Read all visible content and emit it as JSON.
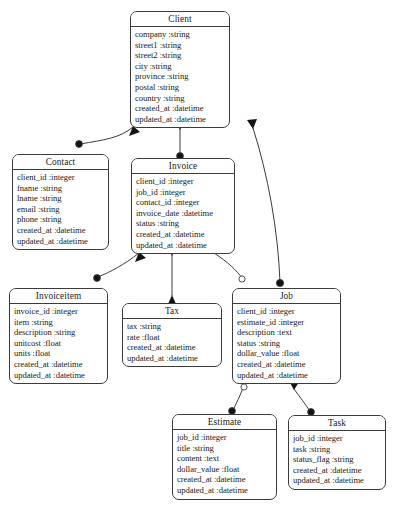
{
  "diagram": {
    "kind": "entity-relationship-diagram",
    "background_color": "#ffffff",
    "line_color": "#3b3b3b",
    "text_color": "#1a1a1a",
    "width": 393,
    "height": 506,
    "entities": [
      {
        "id": "client",
        "name": "Client",
        "fields": [
          "company :string",
          "street1 :string",
          "street2 :string",
          "city :string",
          "province :string",
          "postal :string",
          "country :string",
          "created_at :datetime",
          "updated_at :datetime"
        ]
      },
      {
        "id": "contact",
        "name": "Contact",
        "fields": [
          "client_id :integer",
          "fname :string",
          "lname :string",
          "email :string",
          "phone :string",
          "created_at :datetime",
          "updated_at :datetime"
        ]
      },
      {
        "id": "invoice",
        "name": "Invoice",
        "fields": [
          "client_id :integer",
          "job_id :integer",
          "contact_id :integer",
          "invoice_date :datetime",
          "status :string",
          "created_at :datetime",
          "updated_at :datetime"
        ]
      },
      {
        "id": "invoiceitem",
        "name": "Invoiceitem",
        "fields": [
          "invoice_id :integer",
          "item :string",
          "description :string",
          "unitcost :float",
          "units :float",
          "created_at :datetime",
          "updated_at :datetime"
        ]
      },
      {
        "id": "tax",
        "name": "Tax",
        "fields": [
          "tax :string",
          "rate :float",
          "created_at :datetime",
          "updated_at :datetime"
        ]
      },
      {
        "id": "job",
        "name": "Job",
        "fields": [
          "client_id :integer",
          "estimate_id :integer",
          "description :text",
          "status :string",
          "dollar_value :float",
          "created_at :datetime",
          "updated_at :datetime"
        ]
      },
      {
        "id": "estimate",
        "name": "Estimate",
        "fields": [
          "job_id :integer",
          "title :string",
          "content :text",
          "dollar_value :float",
          "created_at :datetime",
          "updated_at :datetime"
        ]
      },
      {
        "id": "task",
        "name": "Task",
        "fields": [
          "job_id :integer",
          "task :string",
          "status_flag :string",
          "created_at :datetime",
          "updated_at :datetime"
        ]
      }
    ],
    "relationships": [
      {
        "from": "client",
        "to": "contact",
        "from_marker": "arrow",
        "to_marker": "dot"
      },
      {
        "from": "client",
        "to": "invoice",
        "from_marker": "arrow",
        "to_marker": "dot"
      },
      {
        "from": "client",
        "to": "job",
        "from_marker": "arrow",
        "to_marker": "dot"
      },
      {
        "from": "invoice",
        "to": "invoiceitem",
        "from_marker": "arrow",
        "to_marker": "dot"
      },
      {
        "from": "invoice",
        "to": "tax",
        "from_marker": "arrow",
        "to_marker": "arrow"
      },
      {
        "from": "invoice",
        "to": "job",
        "from_marker": "arrow",
        "to_marker": "circle"
      },
      {
        "from": "job",
        "to": "estimate",
        "from_marker": "circle",
        "to_marker": "dot"
      },
      {
        "from": "job",
        "to": "task",
        "from_marker": "arrow",
        "to_marker": "dot"
      }
    ]
  }
}
